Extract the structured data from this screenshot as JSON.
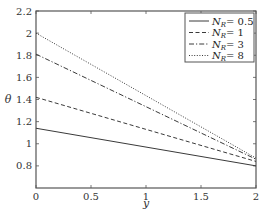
{
  "chart_data": {
    "type": "line",
    "title": "",
    "xlabel": "y",
    "ylabel": "θ",
    "xlim": [
      0,
      2
    ],
    "ylim": [
      0.6,
      2.2
    ],
    "xticks": [
      0,
      0.5,
      1,
      1.5,
      2
    ],
    "xtick_labels": [
      "0",
      "0.5",
      "1",
      "1.5",
      "2"
    ],
    "yticks": [
      0.8,
      1.0,
      1.2,
      1.4,
      1.6,
      1.8,
      2.0,
      2.2
    ],
    "ytick_labels": [
      "0.8",
      "1",
      "1.2",
      "1.4",
      "1.6",
      "1.8",
      "2",
      "2.2"
    ],
    "grid": false,
    "legend_position": "upper right",
    "x": [
      0,
      2
    ],
    "series": [
      {
        "name": "N_R = 0.5",
        "label_main": "N",
        "label_sub": "R",
        "label_value": "= 0.5",
        "style": "solid",
        "values": [
          1.14,
          0.8
        ]
      },
      {
        "name": "N_R = 1",
        "label_main": "N",
        "label_sub": "R",
        "label_value": "= 1",
        "style": "dashed",
        "values": [
          1.42,
          0.84
        ]
      },
      {
        "name": "N_R = 3",
        "label_main": "N",
        "label_sub": "R",
        "label_value": "= 3",
        "style": "dashdot",
        "values": [
          1.81,
          0.86
        ]
      },
      {
        "name": "N_R = 8",
        "label_main": "N",
        "label_sub": "R",
        "label_value": "= 8",
        "style": "dotted",
        "values": [
          2.0,
          0.87
        ]
      }
    ]
  },
  "colors": {
    "line": "#3a3a3a",
    "axis": "#555555",
    "background": "#ffffff"
  }
}
